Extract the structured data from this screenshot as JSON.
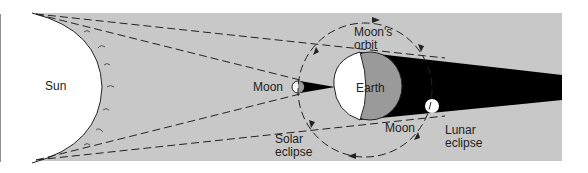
{
  "diagram": {
    "colors": {
      "background": "#ffffff",
      "space": "#c8c8c8",
      "sun": "#ffffff",
      "umbra": "#000000",
      "earth_day": "#ffffff",
      "earth_night": "#9a9a9a",
      "lines": "#222222"
    },
    "labels": {
      "sun": "Sun",
      "moon_left": "Moon",
      "earth": "Earth",
      "orbit_line1": "Moon's",
      "orbit_line2": "orbit",
      "moon_bottom": "Moon",
      "solar_line1": "Solar",
      "solar_line2": "eclipse",
      "lunar_line1": "Lunar",
      "lunar_line2": "eclipse"
    }
  }
}
